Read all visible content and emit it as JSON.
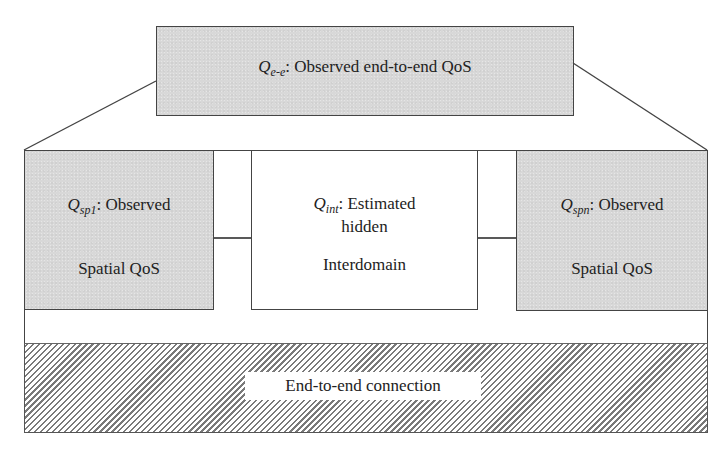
{
  "diagram": {
    "top_box": {
      "symbol": "Q",
      "subscript": "e-e",
      "text": ": Observed end-to-end QoS"
    },
    "left_box": {
      "symbol": "Q",
      "subscript": "sp1",
      "line1": ": Observed",
      "line2": "Spatial QoS"
    },
    "middle_box": {
      "symbol": "Q",
      "subscript": "int",
      "line1": ": Estimated",
      "line2": "hidden",
      "line3": "Interdomain"
    },
    "right_box": {
      "symbol": "Q",
      "subscript": "spn",
      "line1": ": Observed",
      "line2": "Spatial QoS"
    },
    "connection": {
      "label": "End-to-end connection"
    },
    "arrows": [
      {
        "from": "left_box",
        "to": "middle_box"
      },
      {
        "from": "middle_box",
        "to": "right_box"
      }
    ],
    "colors": {
      "box_fill": "#d8d8d8",
      "border": "#444444",
      "hatch": "#7a7a7a"
    }
  }
}
